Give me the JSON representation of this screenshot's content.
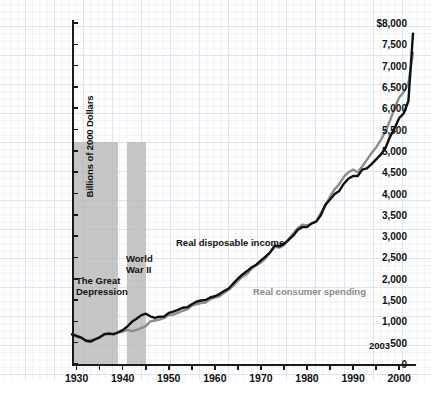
{
  "chart_data": {
    "type": "line",
    "title": "",
    "xlabel": "",
    "ylabel": "Billions of 2000 Dollars",
    "xlim": [
      1929,
      2003
    ],
    "ylim": [
      0,
      8000
    ],
    "y_tick_labels": [
      "$8,000",
      "7,500",
      "7,000",
      "6,500",
      "6,000",
      "5,500",
      "5,000",
      "4,500",
      "4,000",
      "3,500",
      "3,000",
      "2,500",
      "2,000",
      "1,500",
      "1,000",
      "500",
      "0"
    ],
    "y_tick_values": [
      8000,
      7500,
      7000,
      6500,
      6000,
      5500,
      5000,
      4500,
      4000,
      3500,
      3000,
      2500,
      2000,
      1500,
      1000,
      500,
      0
    ],
    "x_tick_labels": [
      "1930",
      "1940",
      "1950",
      "1960",
      "1970",
      "1980",
      "1990",
      "2000"
    ],
    "x_tick_values": [
      1930,
      1940,
      1950,
      1960,
      1970,
      1980,
      1990,
      2000
    ],
    "x_minor_ticks": [
      1935,
      1945,
      1955,
      1965,
      1975,
      1985,
      1995
    ],
    "grid": true,
    "legend_position": "inline-annotations",
    "end_year_label": "2003",
    "x": [
      1929,
      1930,
      1931,
      1932,
      1933,
      1934,
      1935,
      1936,
      1937,
      1938,
      1939,
      1940,
      1941,
      1942,
      1943,
      1944,
      1945,
      1946,
      1947,
      1948,
      1949,
      1950,
      1951,
      1952,
      1953,
      1954,
      1955,
      1956,
      1957,
      1958,
      1959,
      1960,
      1961,
      1962,
      1963,
      1964,
      1965,
      1966,
      1967,
      1968,
      1969,
      1970,
      1971,
      1972,
      1973,
      1974,
      1975,
      1976,
      1977,
      1978,
      1979,
      1980,
      1981,
      1982,
      1983,
      1984,
      1985,
      1986,
      1987,
      1988,
      1989,
      1990,
      1991,
      1992,
      1993,
      1994,
      1995,
      1996,
      1997,
      1998,
      1999,
      2000,
      2001,
      2002,
      2003
    ],
    "series": [
      {
        "name": "Real disposable income",
        "color": "#111111",
        "values": [
          700,
          660,
          620,
          545,
          525,
          575,
          625,
          700,
          715,
          700,
          745,
          795,
          880,
          990,
          1060,
          1140,
          1180,
          1120,
          1080,
          1110,
          1115,
          1200,
          1230,
          1270,
          1320,
          1330,
          1400,
          1460,
          1490,
          1500,
          1560,
          1590,
          1640,
          1710,
          1770,
          1890,
          2000,
          2100,
          2180,
          2270,
          2330,
          2430,
          2520,
          2620,
          2780,
          2760,
          2820,
          2910,
          3010,
          3150,
          3210,
          3210,
          3300,
          3340,
          3490,
          3740,
          3860,
          3990,
          4060,
          4230,
          4350,
          4410,
          4410,
          4560,
          4590,
          4690,
          4800,
          4910,
          5060,
          5330,
          5530,
          5770,
          5880,
          6170,
          7750
        ]
      },
      {
        "name": "Real consumer spending",
        "color": "#8c8c8c",
        "values": [
          680,
          640,
          610,
          560,
          560,
          590,
          630,
          680,
          700,
          690,
          730,
          760,
          800,
          770,
          800,
          840,
          890,
          1000,
          1020,
          1040,
          1080,
          1150,
          1160,
          1200,
          1250,
          1280,
          1370,
          1400,
          1430,
          1440,
          1520,
          1560,
          1590,
          1670,
          1740,
          1840,
          1950,
          2050,
          2110,
          2240,
          2320,
          2380,
          2480,
          2620,
          2750,
          2730,
          2790,
          2930,
          3060,
          3190,
          3270,
          3250,
          3290,
          3350,
          3540,
          3720,
          3930,
          4100,
          4220,
          4390,
          4500,
          4560,
          4500,
          4640,
          4790,
          4950,
          5080,
          5250,
          5450,
          5710,
          6000,
          6250,
          6380,
          6580,
          7300
        ]
      }
    ],
    "shaded_regions": [
      {
        "label": "The Great\nDepression",
        "start": 1929,
        "end": 1939,
        "color": "#b6b6b6",
        "top_value": 5200
      },
      {
        "label": "World\nWar II",
        "start": 1941,
        "end": 1945,
        "color": "#b6b6b6",
        "top_value": 5200
      }
    ],
    "annotations": [
      {
        "name": "income-label",
        "text": "Real disposable income",
        "color": "#111111"
      },
      {
        "name": "spending-label",
        "text": "Real consumer spending",
        "color": "#8c8c8c"
      },
      {
        "name": "great-depression-label",
        "text": "The Great\nDepression",
        "color": "#111111"
      },
      {
        "name": "world-war-ii-label",
        "text": "World\nWar II",
        "color": "#111111"
      },
      {
        "name": "end-year-label",
        "text": "2003",
        "color": "#111111"
      }
    ]
  }
}
